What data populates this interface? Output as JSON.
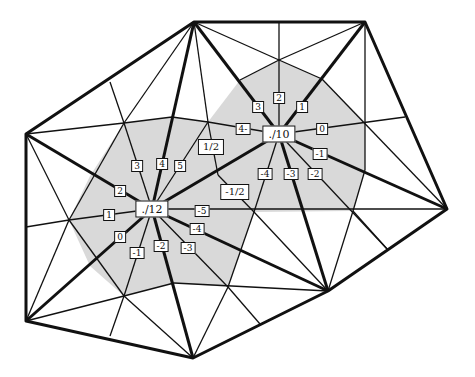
{
  "diagram": {
    "shade_color": "#d9d9d9",
    "line_color": "#111111",
    "centers": [
      {
        "id": "c12",
        "label": "./12",
        "x": 152,
        "y": 209
      },
      {
        "id": "c10",
        "label": "./10",
        "x": 279,
        "y": 134
      }
    ],
    "fractions": [
      {
        "label": "1/2",
        "x": 211,
        "y": 147
      },
      {
        "label": "-1/2",
        "x": 235,
        "y": 192
      }
    ],
    "labels_c12": [
      {
        "label": "3",
        "x": 137,
        "y": 166
      },
      {
        "label": "4",
        "x": 162,
        "y": 164
      },
      {
        "label": "5",
        "x": 180,
        "y": 166
      },
      {
        "label": "2",
        "x": 120,
        "y": 191
      },
      {
        "label": "1",
        "x": 109,
        "y": 215
      },
      {
        "label": "0",
        "x": 120,
        "y": 237
      },
      {
        "label": "-1",
        "x": 137,
        "y": 253
      },
      {
        "label": "-2",
        "x": 161,
        "y": 246
      },
      {
        "label": "-3",
        "x": 188,
        "y": 248
      },
      {
        "label": "-4",
        "x": 197,
        "y": 229
      },
      {
        "label": "-5",
        "x": 202,
        "y": 211
      }
    ],
    "labels_c10": [
      {
        "label": "3",
        "x": 258,
        "y": 107
      },
      {
        "label": "2",
        "x": 279,
        "y": 98
      },
      {
        "label": "1",
        "x": 302,
        "y": 107
      },
      {
        "label": "4-",
        "x": 243,
        "y": 129
      },
      {
        "label": "0",
        "x": 322,
        "y": 129
      },
      {
        "label": "-1",
        "x": 320,
        "y": 154
      },
      {
        "label": "-2",
        "x": 315,
        "y": 174
      },
      {
        "label": "-3",
        "x": 291,
        "y": 174
      },
      {
        "label": "-4",
        "x": 265,
        "y": 174
      }
    ]
  }
}
